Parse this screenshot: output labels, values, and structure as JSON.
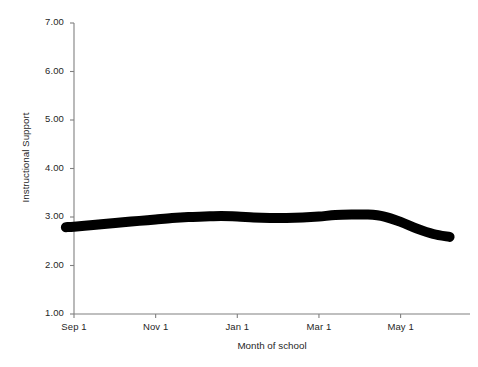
{
  "chart_data": {
    "type": "line",
    "title": "",
    "subtitle": "",
    "xlabel": "Month of school",
    "ylabel": "Instructional Support",
    "xlim": [
      0,
      9.7
    ],
    "ylim": [
      1.0,
      7.0
    ],
    "grid": false,
    "legend": null,
    "line_color": "#000000",
    "line_width_px": 10,
    "axis_color": "#808080",
    "x_tick_labels": [
      "Sep 1",
      "Nov 1",
      "Jan 1",
      "Mar 1",
      "May 1"
    ],
    "x_tick_values": [
      0,
      2,
      4,
      6,
      8
    ],
    "y_tick_labels": [
      "1.00",
      "2.00",
      "3.00",
      "4.00",
      "5.00",
      "6.00",
      "7.00"
    ],
    "y_tick_values": [
      1.0,
      2.0,
      3.0,
      4.0,
      5.0,
      6.0,
      7.0
    ],
    "series": [
      {
        "name": "Instructional Support",
        "x": [
          -0.2,
          0.0,
          0.4,
          0.8,
          1.2,
          1.6,
          2.0,
          2.4,
          2.8,
          3.2,
          3.6,
          4.0,
          4.4,
          4.8,
          5.2,
          5.6,
          6.0,
          6.4,
          6.8,
          7.2,
          7.6,
          8.0,
          8.4,
          8.8,
          9.2
        ],
        "y": [
          2.79,
          2.8,
          2.83,
          2.86,
          2.89,
          2.92,
          2.95,
          2.98,
          3.0,
          3.01,
          3.02,
          3.01,
          2.99,
          2.98,
          2.98,
          2.99,
          3.01,
          3.04,
          3.05,
          3.05,
          3.01,
          2.9,
          2.76,
          2.65,
          2.59
        ]
      }
    ],
    "value_range_observed": {
      "min": 2.59,
      "max": 3.05,
      "start": 2.79,
      "end": 2.59
    }
  },
  "axes": {
    "y_axis_name": "y-axis",
    "x_axis_name": "x-axis"
  }
}
